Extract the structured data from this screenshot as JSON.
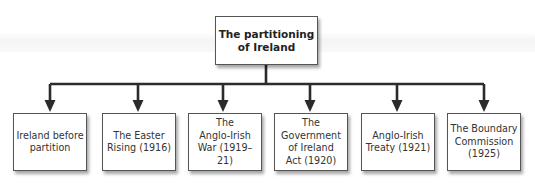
{
  "diagram": {
    "type": "hierarchy",
    "root": {
      "label": "The partitioning\nof Ireland"
    },
    "children": [
      {
        "label": "Ireland before\npartition"
      },
      {
        "label": "The Easter\nRising (1916)"
      },
      {
        "label": "The\nAnglo-Irish\nWar (1919–21)"
      },
      {
        "label": "The\nGovernment\nof Ireland\nAct (1920)"
      },
      {
        "label": "Anglo-Irish\nTreaty (1921)"
      },
      {
        "label": "The Boundary\nCommission\n(1925)"
      }
    ],
    "colors": {
      "line": "#2b2b2b",
      "box_border": "#555555",
      "text": "#333333"
    }
  }
}
